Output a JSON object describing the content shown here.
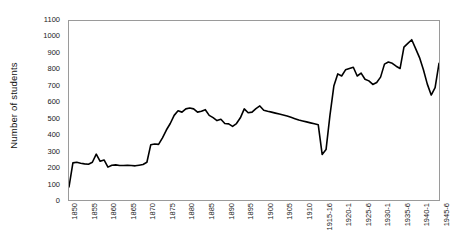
{
  "chart_data": {
    "type": "line",
    "title": "",
    "xlabel": "",
    "ylabel": "Number of students",
    "ylim": [
      0,
      1100
    ],
    "ystep": 100,
    "grid": false,
    "legend": false,
    "line_color": "#000000",
    "plot_border_color": "#9a9a9a",
    "background_color": "#ffffff",
    "y_ticks": [
      1100,
      1000,
      900,
      800,
      700,
      600,
      500,
      400,
      300,
      200,
      100,
      0
    ],
    "x_tick_labels": [
      "1850",
      "1855",
      "1860",
      "1865",
      "1870",
      "1875",
      "1880",
      "1885",
      "1890",
      "1895",
      "1900",
      "1905",
      "1910",
      "1915-16",
      "1920-1",
      "1925-6",
      "1930-1",
      "1935-6",
      "1940-1",
      "1945-6"
    ],
    "x_tick_indices": [
      0,
      5,
      10,
      15,
      20,
      25,
      30,
      35,
      40,
      45,
      50,
      55,
      60,
      65,
      70,
      75,
      80,
      85,
      90,
      95
    ],
    "x_point_labels": [
      "1850",
      "1851",
      "1852",
      "1853",
      "1854",
      "1855",
      "1856",
      "1857",
      "1858",
      "1859",
      "1860",
      "1861",
      "1862",
      "1863",
      "1864",
      "1865",
      "1866",
      "1867",
      "1868",
      "1869",
      "1870",
      "1871",
      "1872",
      "1873",
      "1874",
      "1875",
      "1876",
      "1877",
      "1878",
      "1879",
      "1880",
      "1881",
      "1882",
      "1883",
      "1884",
      "1885",
      "1886",
      "1887",
      "1888",
      "1889",
      "1890",
      "1891",
      "1892",
      "1893",
      "1894",
      "1895",
      "1896",
      "1897",
      "1898",
      "1899",
      "1900",
      "1901",
      "1902",
      "1903",
      "1904",
      "1905",
      "1906",
      "1907",
      "1908",
      "1909",
      "1910",
      "1911",
      "1912",
      "1913",
      "1914",
      "1915-16",
      "1916-17",
      "1917-18",
      "1918-19",
      "1919-20",
      "1920-1",
      "1921-2",
      "1922-3",
      "1923-4",
      "1924-5",
      "1925-6",
      "1926-7",
      "1927-8",
      "1928-9",
      "1929-30",
      "1930-1",
      "1931-2",
      "1932-3",
      "1933-4",
      "1934-5",
      "1935-6",
      "1936-7",
      "1937-8",
      "1938-9",
      "1939-40",
      "1940-1",
      "1941-2",
      "1942-3",
      "1943-4",
      "1944-5",
      "1945-6"
    ],
    "values": [
      80,
      228,
      232,
      226,
      222,
      220,
      232,
      282,
      238,
      246,
      202,
      214,
      216,
      212,
      212,
      214,
      212,
      210,
      214,
      218,
      232,
      340,
      344,
      342,
      382,
      430,
      470,
      520,
      548,
      540,
      560,
      565,
      560,
      540,
      545,
      555,
      520,
      506,
      488,
      496,
      470,
      468,
      452,
      470,
      505,
      560,
      536,
      540,
      562,
      578,
      552,
      545,
      540,
      534,
      528,
      522,
      516,
      508,
      500,
      492,
      486,
      480,
      474,
      468,
      462,
      280,
      310,
      520,
      700,
      775,
      762,
      800,
      808,
      816,
      762,
      780,
      742,
      732,
      710,
      722,
      755,
      835,
      848,
      840,
      822,
      808,
      940,
      962,
      985,
      930,
      875,
      800,
      712,
      645,
      690,
      840
    ]
  }
}
